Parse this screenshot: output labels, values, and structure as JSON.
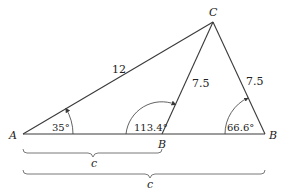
{
  "diagram": {
    "vertices": {
      "A": {
        "label": "A"
      },
      "B1": {
        "label": "B"
      },
      "B2": {
        "label": "B"
      },
      "C": {
        "label": "C"
      }
    },
    "sides": {
      "AC": "12",
      "B1C": "7.5",
      "B2C": "7.5"
    },
    "angles": {
      "A": "35°",
      "B1": "113.4°",
      "B2": "66.6°"
    },
    "braces": {
      "short": "c",
      "long": "c"
    },
    "colors": {
      "line": "#3a3a3a",
      "brace": "#6a6a6a",
      "text": "#222222"
    }
  }
}
